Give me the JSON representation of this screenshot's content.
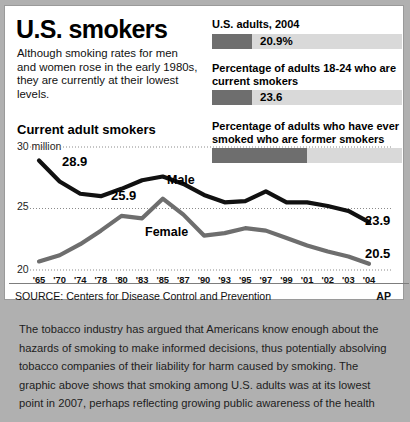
{
  "graphic": {
    "headline": "U.S. smokers",
    "deck": "Although smoking rates for men and women rose in the early 1980s, they are currently at their lowest levels.",
    "chart_title": "Current adult smokers",
    "source": "SOURCE: Centers for Disease Control and Prevention",
    "credit": "AP"
  },
  "stats": [
    {
      "label": "U.S. adults, 2004",
      "value": "20.9%",
      "fill_percent": 21
    },
    {
      "label": "Percentage of adults 18-24 who are current smokers",
      "value": "23.6",
      "fill_percent": 24
    },
    {
      "label": "Percentage of adults who have ever smoked who are former smokers",
      "value": "",
      "fill_percent": 50
    }
  ],
  "annotations": {
    "male_label": "Male",
    "female_label": "Female",
    "male_start": "28.9",
    "female_peak": "25.9",
    "male_end": "23.9",
    "female_end": "20.5"
  },
  "colors": {
    "male_line": "#111111",
    "female_line": "#6e6e6e",
    "bar_fill": "#6e6e6e",
    "bar_track": "#d9d9d9",
    "page_background": "#b0b0b0",
    "card_background": "#ffffff"
  },
  "caption": "The tobacco industry has argued that Americans know enough about the hazards of smoking to make informed decisions, thus potentially absolving tobacco companies of their liability for harm caused by smoking. The graphic above shows that smoking among U.S. adults was at its lowest point in 2007, perhaps reflecting growing public awareness of the health",
  "chart_data": {
    "type": "line",
    "title": "Current adult smokers",
    "xlabel": "",
    "ylabel": "30 million",
    "ylim": [
      20,
      30
    ],
    "yticks": [
      20,
      25,
      30
    ],
    "ytick_labels": [
      "20",
      "25",
      "30 million"
    ],
    "grid": true,
    "legend": "inline",
    "x": [
      "'65",
      "'70",
      "'74",
      "'78",
      "'80",
      "'83",
      "'85",
      "'87",
      "'90",
      "'93",
      "'95",
      "'97",
      "'99",
      "'01",
      "'02",
      "'03",
      "'04"
    ],
    "series": [
      {
        "name": "Male",
        "color": "#111111",
        "values": [
          28.9,
          27.2,
          26.2,
          26.0,
          26.6,
          27.3,
          27.6,
          27.0,
          26.1,
          25.5,
          25.6,
          26.4,
          25.5,
          25.5,
          25.2,
          24.8,
          23.9
        ]
      },
      {
        "name": "Female",
        "color": "#6e6e6e",
        "values": [
          20.7,
          21.2,
          22.1,
          23.2,
          24.4,
          24.2,
          25.8,
          24.5,
          22.8,
          23.0,
          23.4,
          23.2,
          22.6,
          22.0,
          21.5,
          21.1,
          20.5
        ]
      }
    ],
    "point_labels": [
      {
        "series": "Male",
        "x": "'65",
        "text": "28.9"
      },
      {
        "series": "Female",
        "x": "'85",
        "text": "25.9"
      },
      {
        "series": "Male",
        "x": "'04",
        "text": "23.9"
      },
      {
        "series": "Female",
        "x": "'04",
        "text": "20.5"
      }
    ]
  }
}
